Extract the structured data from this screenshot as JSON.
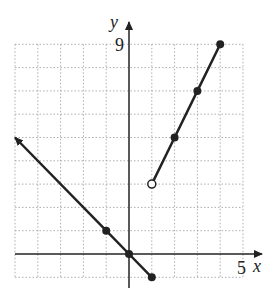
{
  "chart_data": {
    "type": "line",
    "title": "",
    "xlabel": "x",
    "ylabel": "y",
    "xlim": [
      -5,
      5
    ],
    "ylim": [
      -1,
      9
    ],
    "tick_labels": {
      "x": [
        "5"
      ],
      "y": [
        "9"
      ]
    },
    "grid": true,
    "series": [
      {
        "name": "piece 1: y = -x (x <= 1)",
        "points": [
          [
            -5,
            5
          ],
          [
            -1,
            1
          ],
          [
            0,
            0
          ],
          [
            1,
            -1
          ]
        ],
        "marked_points": [
          [
            -1,
            1
          ],
          [
            0,
            0
          ],
          [
            1,
            -1
          ]
        ],
        "endpoint_closed": [
          1,
          -1
        ],
        "arrow_end": [
          -5,
          5
        ]
      },
      {
        "name": "piece 2: y = 2x + 1 (x > 1)",
        "points": [
          [
            1,
            3
          ],
          [
            2,
            5
          ],
          [
            3,
            7
          ],
          [
            4,
            9
          ]
        ],
        "marked_points": [
          [
            2,
            5
          ],
          [
            3,
            7
          ],
          [
            4,
            9
          ]
        ],
        "endpoint_open": [
          1,
          3
        ],
        "arrow_end": [
          4,
          9
        ]
      }
    ]
  },
  "axes": {
    "x_label": "x",
    "y_label": "y",
    "x_tick": "5",
    "y_tick": "9"
  }
}
